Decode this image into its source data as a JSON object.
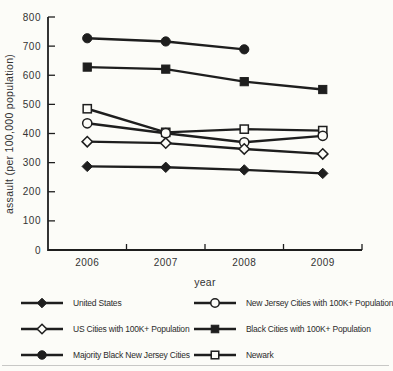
{
  "chart_data": {
    "type": "line",
    "xlabel": "year",
    "ylabel": "assault (per 100,000 population)",
    "ylim": [
      0,
      800
    ],
    "yticks": [
      0,
      100,
      200,
      300,
      400,
      500,
      600,
      700,
      800
    ],
    "categories": [
      "2006",
      "2007",
      "2008",
      "2009"
    ],
    "series": [
      {
        "name": "United States",
        "marker": "diamond-filled",
        "values": [
          287,
          284,
          275,
          263
        ]
      },
      {
        "name": "US Cities with 100K+ Population",
        "marker": "diamond-open",
        "values": [
          372,
          367,
          347,
          330
        ]
      },
      {
        "name": "Majority Black New Jersey Cities",
        "marker": "circle-filled",
        "values": [
          727,
          716,
          689,
          null
        ]
      },
      {
        "name": "New Jersey Cities with 100K+ Population",
        "marker": "circle-open",
        "values": [
          435,
          401,
          370,
          392
        ]
      },
      {
        "name": "Black Cities with 100K+ Population",
        "marker": "square-filled",
        "values": [
          628,
          621,
          578,
          551
        ]
      },
      {
        "name": "Newark",
        "marker": "square-open",
        "values": [
          485,
          404,
          415,
          410
        ]
      }
    ],
    "line_color": "#1e1e1e",
    "background": "#fcfcf8",
    "grid": false,
    "legend_position": "bottom"
  }
}
